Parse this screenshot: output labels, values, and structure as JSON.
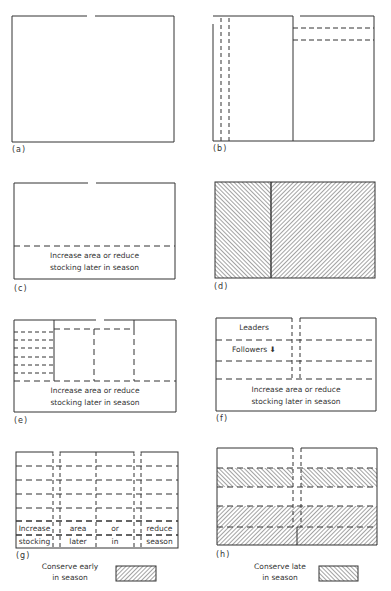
{
  "figure": {
    "panels": [
      {
        "id": "a",
        "label": "(a)"
      },
      {
        "id": "b",
        "label": "(b)"
      },
      {
        "id": "c",
        "label": "(c)",
        "text_line1": "Increase area or reduce",
        "text_line2": "stocking later in season"
      },
      {
        "id": "d",
        "label": "(d)"
      },
      {
        "id": "e",
        "label": "(e)",
        "text_line1": "Increase area or reduce",
        "text_line2": "stocking later in season"
      },
      {
        "id": "f",
        "label": "(f)",
        "leaders": "Leaders",
        "followers": "Followers",
        "text_line1": "Increase area or reduce",
        "text_line2": "stocking later in season"
      },
      {
        "id": "g",
        "label": "(g)",
        "row1": [
          "Increase",
          "area",
          "or",
          "reduce"
        ],
        "row2": [
          "stocking",
          "later",
          "in",
          "season"
        ]
      },
      {
        "id": "h",
        "label": "(h)"
      }
    ],
    "legend": {
      "early": {
        "line1": "Conserve early",
        "line2": "in season"
      },
      "late": {
        "line1": "Conserve late",
        "line2": "in season"
      }
    }
  }
}
